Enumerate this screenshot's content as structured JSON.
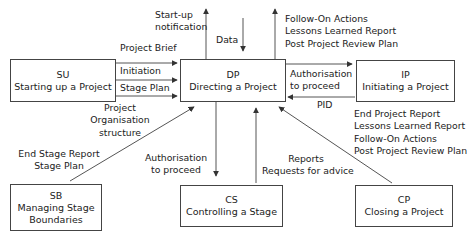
{
  "diagram": {
    "nodes": {
      "su": {
        "code": "SU",
        "name": "Starting up a Project"
      },
      "dp": {
        "code": "DP",
        "name": "Directing a Project"
      },
      "ip": {
        "code": "IP",
        "name": "Initiating a Project"
      },
      "sb": {
        "code": "SB",
        "name1": "Managing Stage",
        "name2": "Boundaries"
      },
      "cs": {
        "code": "CS",
        "name": "Controlling a Stage"
      },
      "cp": {
        "code": "CP",
        "name": "Closing a Project"
      }
    },
    "labels": {
      "startup_notification": [
        "Start-up",
        "notification"
      ],
      "data": "Data",
      "dp_top_outputs": [
        "Follow-On Actions",
        "Lessons Learned Report",
        "Post Project Review Plan"
      ],
      "project_brief": "Project Brief",
      "initiation": "Initiation",
      "stage_plan": "Stage Plan",
      "authorisation_ip": [
        "Authorisation",
        "to proceed"
      ],
      "pid": "PID",
      "project_org": [
        "Project",
        "Organisation",
        "structure"
      ],
      "sb_outputs": [
        "End Stage Report",
        "Stage Plan"
      ],
      "authorisation_cs": [
        "Authorisation",
        "to proceed"
      ],
      "cs_outputs": [
        "Reports",
        "Requests for advice"
      ],
      "cp_outputs": [
        "End Project Report",
        "Lessons Learned Report",
        "Follow-On Actions",
        "Post Project Review Plan"
      ]
    }
  }
}
